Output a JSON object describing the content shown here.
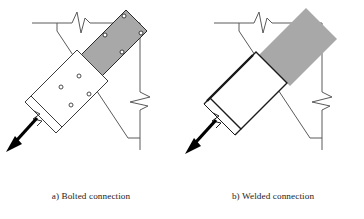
{
  "figure": {
    "panels": [
      {
        "id": "a",
        "caption": "a) Bolted connection",
        "connection_type": "bolted",
        "gusset": {
          "name": "gusset-plate",
          "fill": "#a8a8a8",
          "stroke": "#2b2b2b",
          "bolt_count": 4,
          "bolts_label": "bolt-hole"
        },
        "brace": {
          "name": "brace-member",
          "fill": "#ffffff",
          "stroke": "#3a3a3a",
          "splice_plate": "double-line",
          "bolt_count": 4,
          "break_symbol": true
        },
        "force_arrow": {
          "name": "brace-force-arrow",
          "direction": "down-left",
          "color": "#000000"
        }
      },
      {
        "id": "b",
        "caption": "b) Welded connection",
        "connection_type": "welded",
        "gusset": {
          "name": "gusset-plate",
          "fill": "#a8a8a8",
          "stroke": "none",
          "bolt_count": 0,
          "bolts_label": "none"
        },
        "brace": {
          "name": "brace-member",
          "fill": "#ffffff",
          "stroke": "#1a1a1a",
          "splice_plate": "weld-line",
          "bolt_count": 0,
          "break_symbol": true
        },
        "force_arrow": {
          "name": "brace-force-arrow",
          "direction": "down-left",
          "color": "#000000"
        }
      }
    ],
    "frame": {
      "beam_label": "beam",
      "column_label": "column",
      "break_symbol_label": "break-line",
      "stroke": "#5a5a5a"
    },
    "colors": {
      "gusset_fill": "#a8a8a8",
      "line": "#5a5a5a",
      "heavy_line": "#1a1a1a",
      "background": "#ffffff",
      "text": "#1c1c1c"
    }
  }
}
